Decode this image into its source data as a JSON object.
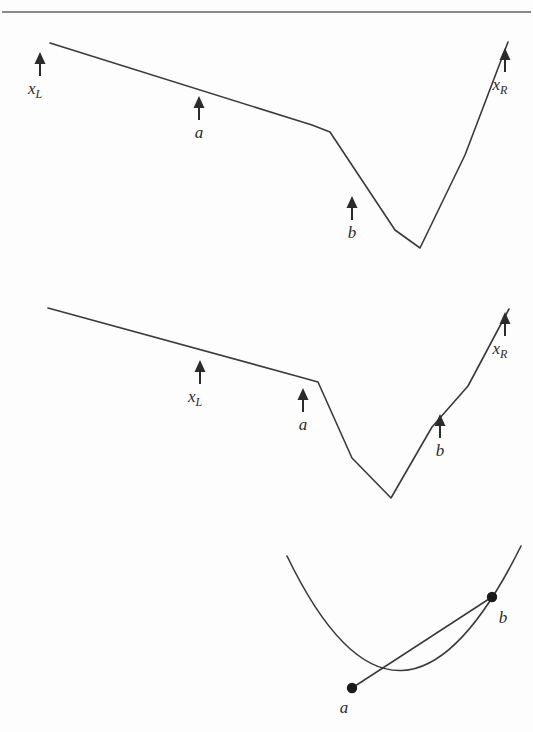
{
  "figure": {
    "background_color": "#fdfdfd",
    "ink_color": "#3a3a3a",
    "rule_color": "#8a8a8a",
    "arrow_glyph": "up-arrow",
    "panels": [
      {
        "id": "panel-1",
        "name": "bracket-wide",
        "description": "Piecewise-linear function with arrows marking x_L, a and b; bracket is wide.",
        "labels": [
          {
            "id": "p1-xl",
            "base": "x",
            "sub": "L",
            "text": "xL",
            "arrow_x": 40,
            "arrow_tip_y": 52,
            "arrow_tail_y": 76,
            "label_x": 40,
            "label_y": 94
          },
          {
            "id": "p1-a",
            "base": "a",
            "sub": "",
            "text": "a",
            "arrow_x": 199,
            "arrow_tip_y": 96,
            "arrow_tail_y": 120,
            "label_x": 199,
            "label_y": 138
          },
          {
            "id": "p1-b",
            "base": "b",
            "sub": "",
            "text": "b",
            "arrow_x": 352,
            "arrow_tip_y": 196,
            "arrow_tail_y": 220,
            "label_x": 352,
            "label_y": 238
          },
          {
            "id": "p1-xr",
            "base": "x",
            "sub": "R",
            "text": "xR",
            "arrow_x": 505,
            "arrow_tip_y": 48,
            "arrow_tail_y": 72,
            "label_x": 505,
            "label_y": 90
          }
        ],
        "curve_points": [
          [
            50,
            43
          ],
          [
            312,
            125
          ],
          [
            330,
            132
          ],
          [
            395,
            230
          ],
          [
            420,
            248
          ],
          [
            465,
            155
          ],
          [
            508,
            42
          ]
        ]
      },
      {
        "id": "panel-2",
        "name": "bracket-narrow",
        "description": "Same piecewise-linear function; arrows moved so x_L and a sit on the left descent and b on the right ascent; bracket is narrower.",
        "labels": [
          {
            "id": "p2-xl",
            "base": "x",
            "sub": "L",
            "text": "xL",
            "arrow_x": 200,
            "arrow_tip_y": 360,
            "arrow_tail_y": 384,
            "label_x": 200,
            "label_y": 402
          },
          {
            "id": "p2-a",
            "base": "a",
            "sub": "",
            "text": "a",
            "arrow_x": 303,
            "arrow_tip_y": 388,
            "arrow_tail_y": 412,
            "label_x": 303,
            "label_y": 430
          },
          {
            "id": "p2-b",
            "base": "b",
            "sub": "",
            "text": "b",
            "arrow_x": 440,
            "arrow_tip_y": 414,
            "arrow_tail_y": 438,
            "label_x": 440,
            "label_y": 456
          },
          {
            "id": "p2-xr",
            "base": "x",
            "sub": "R",
            "text": "xR",
            "arrow_x": 505,
            "arrow_tip_y": 312,
            "arrow_tail_y": 336,
            "label_x": 505,
            "label_y": 354
          }
        ],
        "curve_points": [
          [
            48,
            308
          ],
          [
            300,
            377
          ],
          [
            318,
            382
          ],
          [
            352,
            458
          ],
          [
            391,
            498
          ],
          [
            432,
            427
          ],
          [
            468,
            386
          ],
          [
            509,
            309
          ]
        ]
      },
      {
        "id": "panel-3",
        "name": "convex-chord",
        "description": "Convex (parabolic) curve with two marked points a and b joined by a chord.",
        "curve_control": {
          "start": [
            287,
            556
          ],
          "control": [
            400,
            790
          ],
          "end": [
            521,
            546
          ]
        },
        "points": [
          {
            "id": "p3-a",
            "text": "a",
            "x": 352,
            "y": 688,
            "label_x": 344,
            "label_y": 713
          },
          {
            "id": "p3-b",
            "text": "b",
            "x": 492,
            "y": 597,
            "label_x": 503,
            "label_y": 623
          }
        ],
        "chord": {
          "from": [
            352,
            688
          ],
          "to": [
            492,
            597
          ]
        }
      }
    ],
    "top_rule": {
      "x1": 2,
      "y1": 12,
      "x2": 531,
      "y2": 12
    }
  }
}
